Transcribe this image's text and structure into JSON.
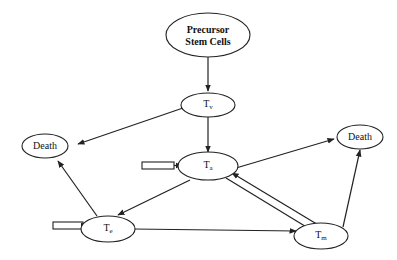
{
  "diagram": {
    "nodes": {
      "precursor": {
        "line1": "Precursor",
        "line2": "Stem Cells"
      },
      "tv": {
        "main": "T",
        "sub": "v"
      },
      "ta": {
        "main": "T",
        "sub": "a"
      },
      "te": {
        "main": "T",
        "sub": "e"
      },
      "tm": {
        "main": "T",
        "sub": "m"
      },
      "death_left": {
        "label": "Death"
      },
      "death_right": {
        "label": "Death"
      }
    },
    "edges": [
      {
        "from": "precursor",
        "to": "tv"
      },
      {
        "from": "tv",
        "to": "ta"
      },
      {
        "from": "tv",
        "to": "death_left"
      },
      {
        "from": "ta",
        "to": "te"
      },
      {
        "from": "ta",
        "to": "death_right"
      },
      {
        "from": "ta",
        "to": "tm"
      },
      {
        "from": "tm",
        "to": "ta"
      },
      {
        "from": "te",
        "to": "death_left"
      },
      {
        "from": "te",
        "to": "tm"
      },
      {
        "from": "tm",
        "to": "death_right"
      },
      {
        "from": "external-input",
        "to": "ta"
      },
      {
        "from": "external-input",
        "to": "te"
      }
    ],
    "colors": {
      "stroke": "#222222",
      "background": "#ffffff"
    }
  }
}
